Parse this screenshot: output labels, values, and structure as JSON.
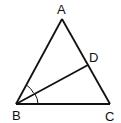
{
  "diagram": {
    "type": "triangle-with-angle-bisector",
    "points": {
      "A": {
        "label": "A",
        "x": 62,
        "y": 19
      },
      "B": {
        "label": "B",
        "x": 16,
        "y": 104
      },
      "C": {
        "label": "C",
        "x": 110,
        "y": 104
      },
      "D": {
        "label": "D",
        "x": 88,
        "y": 65
      }
    },
    "segments": [
      "AB",
      "BC",
      "CA",
      "BD"
    ],
    "angle_marks": [
      "ABD",
      "DBC"
    ],
    "labels": {
      "A": "A",
      "B": "B",
      "C": "C",
      "D": "D"
    },
    "stroke_color": "#111111"
  }
}
